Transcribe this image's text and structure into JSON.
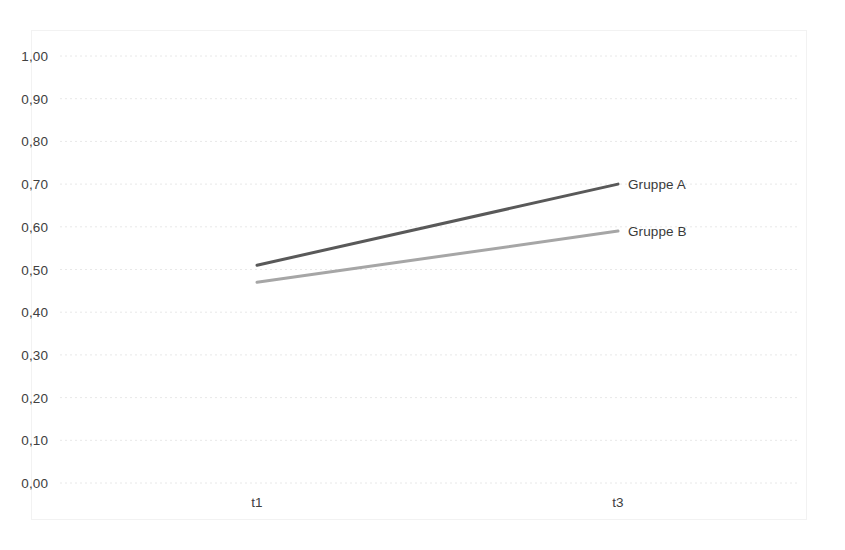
{
  "chart_data": {
    "type": "line",
    "title": "",
    "subtitle": "",
    "xlabel": "",
    "ylabel": "",
    "categories": [
      "t1",
      "t3"
    ],
    "x_tick_labels": [
      "t1",
      "t3"
    ],
    "y_tick_labels": [
      "1,00",
      "0,90",
      "0,80",
      "0,70",
      "0,60",
      "0,50",
      "0,40",
      "0,30",
      "0,20",
      "0,10",
      "0,00"
    ],
    "y_tick_values": [
      1.0,
      0.9,
      0.8,
      0.7,
      0.6,
      0.5,
      0.4,
      0.3,
      0.2,
      0.1,
      0.0
    ],
    "ylim": [
      0.0,
      1.0
    ],
    "y_tick_step": 0.1,
    "decimal_separator": ",",
    "grid": {
      "horizontal": true,
      "vertical": false,
      "style": "dotted",
      "color": "#E8E8E8"
    },
    "legend": {
      "position": "right-of-line-ends",
      "style": "direct-series-labels",
      "entries": [
        "Gruppe A",
        "Gruppe B"
      ]
    },
    "series": [
      {
        "name": "Gruppe A",
        "label": "Gruppe A",
        "color": "#595959",
        "line_width": 3,
        "values": [
          0.51,
          0.7
        ],
        "points": [
          {
            "x": "t1",
            "y": 0.51
          },
          {
            "x": "t3",
            "y": 0.7
          }
        ]
      },
      {
        "name": "Gruppe B",
        "label": "Gruppe B",
        "color": "#A6A6A6",
        "line_width": 3,
        "values": [
          0.47,
          0.59
        ],
        "points": [
          {
            "x": "t1",
            "y": 0.47
          },
          {
            "x": "t3",
            "y": 0.59
          }
        ]
      }
    ],
    "annotations": []
  },
  "axis": {
    "y_labels": [
      {
        "text": "1,00",
        "value": 1.0
      },
      {
        "text": "0,90",
        "value": 0.9
      },
      {
        "text": "0,80",
        "value": 0.8
      },
      {
        "text": "0,70",
        "value": 0.7
      },
      {
        "text": "0,60",
        "value": 0.6
      },
      {
        "text": "0,50",
        "value": 0.5
      },
      {
        "text": "0,40",
        "value": 0.4
      },
      {
        "text": "0,30",
        "value": 0.3
      },
      {
        "text": "0,20",
        "value": 0.2
      },
      {
        "text": "0,10",
        "value": 0.1
      },
      {
        "text": "0,00",
        "value": 0.0
      }
    ],
    "x_labels": [
      {
        "text": "t1"
      },
      {
        "text": "t3"
      }
    ]
  },
  "colors": {
    "series_a": "#595959",
    "series_b": "#A6A6A6",
    "gridline": "#E8E8E8",
    "frame": "#F2F2F2",
    "text": "#404040",
    "background": "#FFFFFF"
  }
}
